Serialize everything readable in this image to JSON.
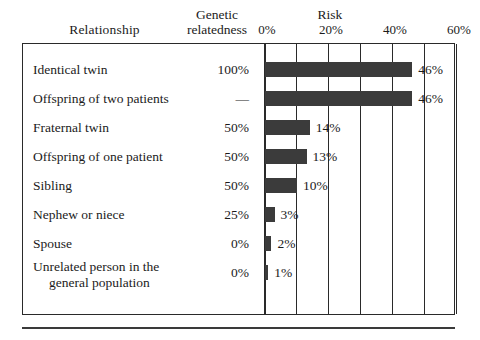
{
  "headers": {
    "relationship": "Relationship",
    "genetic_relatedness_line1": "Genetic",
    "genetic_relatedness_line2": "relatedness",
    "risk": "Risk"
  },
  "axis": {
    "ticks": [
      "0%",
      "20%",
      "40%",
      "60%"
    ],
    "tick_values": [
      0,
      20,
      40,
      60
    ],
    "min": 0,
    "max": 60,
    "gridline_step": 10
  },
  "colors": {
    "bar_fill": "#3b3b3b",
    "frame": "#2a2a2a",
    "text": "#1b1b1b",
    "background": "#ffffff"
  },
  "rows": [
    {
      "relationship": "Identical twin",
      "relationship_line2": "",
      "genetic_relatedness": "100%",
      "risk_label": "46%",
      "risk_value": 46
    },
    {
      "relationship": "Offspring of two patients",
      "relationship_line2": "",
      "genetic_relatedness": "—",
      "risk_label": "46%",
      "risk_value": 46
    },
    {
      "relationship": "Fraternal twin",
      "relationship_line2": "",
      "genetic_relatedness": "50%",
      "risk_label": "14%",
      "risk_value": 14
    },
    {
      "relationship": "Offspring of one patient",
      "relationship_line2": "",
      "genetic_relatedness": "50%",
      "risk_label": "13%",
      "risk_value": 13
    },
    {
      "relationship": "Sibling",
      "relationship_line2": "",
      "genetic_relatedness": "50%",
      "risk_label": "10%",
      "risk_value": 10
    },
    {
      "relationship": "Nephew or niece",
      "relationship_line2": "",
      "genetic_relatedness": "25%",
      "risk_label": "3%",
      "risk_value": 3
    },
    {
      "relationship": "Spouse",
      "relationship_line2": "",
      "genetic_relatedness": "0%",
      "risk_label": "2%",
      "risk_value": 2
    },
    {
      "relationship": "Unrelated person in the",
      "relationship_line2": "general population",
      "genetic_relatedness": "0%",
      "risk_label": "1%",
      "risk_value": 1
    }
  ],
  "chart_data": {
    "type": "bar",
    "orientation": "horizontal",
    "title": "Risk",
    "xlabel": "Risk",
    "ylabel": "Relationship",
    "categories": [
      "Identical twin",
      "Offspring of two patients",
      "Fraternal twin",
      "Offspring of one patient",
      "Sibling",
      "Nephew or niece",
      "Spouse",
      "Unrelated person in the general population"
    ],
    "values": [
      46,
      46,
      14,
      13,
      10,
      3,
      2,
      1
    ],
    "data_labels": [
      "46%",
      "46%",
      "14%",
      "13%",
      "10%",
      "3%",
      "2%",
      "1%"
    ],
    "secondary_column": {
      "name": "Genetic relatedness",
      "values": [
        "100%",
        "—",
        "50%",
        "50%",
        "50%",
        "25%",
        "0%",
        "0%"
      ]
    },
    "xlim": [
      0,
      60
    ],
    "xticks": [
      0,
      20,
      40,
      60
    ],
    "xticklabels": [
      "0%",
      "20%",
      "40%",
      "60%"
    ],
    "grid": true,
    "legend": null
  }
}
